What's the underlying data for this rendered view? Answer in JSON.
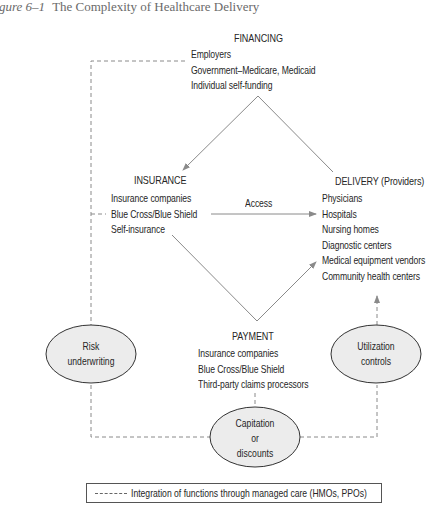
{
  "caption": {
    "figure_label": "gure 6–1",
    "title": "The Complexity of Healthcare Delivery"
  },
  "nodes": {
    "financing": {
      "heading": "FINANCING",
      "items": [
        "Employers",
        "Government–Medicare, Medicaid",
        "Individual self-funding"
      ]
    },
    "insurance": {
      "heading": "INSURANCE",
      "items": [
        "Insurance companies",
        "Blue Cross/Blue Shield",
        "Self-insurance"
      ]
    },
    "delivery": {
      "heading": "DELIVERY (Providers)",
      "items": [
        "Physicians",
        "Hospitals",
        "Nursing homes",
        "Diagnostic centers",
        "Medical equipment vendors",
        "Community health centers"
      ]
    },
    "payment": {
      "heading": "PAYMENT",
      "items": [
        "Insurance companies",
        "Blue Cross/Blue Shield",
        "Third-party claims processors"
      ]
    }
  },
  "edges": {
    "access_label": "Access"
  },
  "ellipses": {
    "risk": [
      "Risk",
      "underwriting"
    ],
    "utilization": [
      "Utilization",
      "controls"
    ],
    "capitation": [
      "Capitation",
      "or",
      "discounts"
    ]
  },
  "legend": {
    "text": "Integration of functions through managed care (HMOs, PPOs)"
  },
  "colors": {
    "solid_line": "#8a8a8a",
    "dashed_line": "#8a8a8a",
    "ellipse_fill": "#ececec",
    "ellipse_stroke": "#333333",
    "text": "#262626"
  }
}
